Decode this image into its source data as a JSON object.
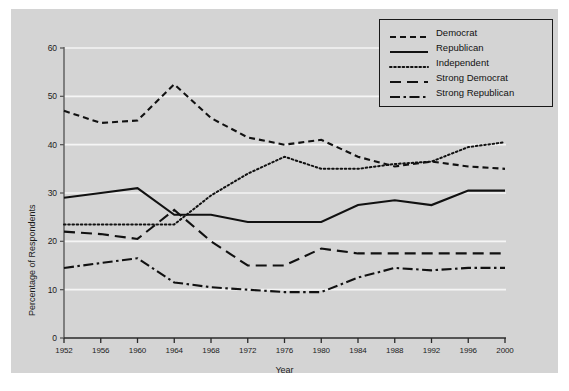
{
  "chart_data": {
    "type": "line",
    "title": "",
    "xlabel": "Year",
    "ylabel": "Percentage of Respondents",
    "grid": true,
    "legend_position": "top-right",
    "xlim": [
      1952,
      2000
    ],
    "ylim": [
      0,
      60
    ],
    "xticks": [
      "1952",
      "1956",
      "1960",
      "1964",
      "1968",
      "1972",
      "1976",
      "1980",
      "1984",
      "1988",
      "1992",
      "1996",
      "2000"
    ],
    "yticks": [
      "0",
      "10",
      "20",
      "30",
      "40",
      "50",
      "60"
    ],
    "x": [
      1952,
      1956,
      1960,
      1964,
      1968,
      1972,
      1976,
      1980,
      1984,
      1988,
      1992,
      1996,
      2000
    ],
    "series": [
      {
        "name": "Democrat",
        "style": "dashed",
        "color": "#111111",
        "values": [
          47.0,
          44.5,
          45.0,
          52.5,
          45.5,
          41.5,
          40.0,
          41.0,
          37.5,
          35.5,
          36.5,
          35.5,
          35.0
        ]
      },
      {
        "name": "Republican",
        "style": "solid",
        "color": "#111111",
        "values": [
          29.0,
          30.0,
          31.0,
          25.5,
          25.5,
          24.0,
          24.0,
          24.0,
          27.5,
          28.5,
          27.5,
          30.5,
          30.5
        ]
      },
      {
        "name": "Independent",
        "style": "dotted",
        "color": "#111111",
        "values": [
          23.5,
          23.5,
          23.5,
          23.5,
          29.5,
          34.0,
          37.5,
          35.0,
          35.0,
          36.0,
          36.5,
          39.5,
          40.5
        ]
      },
      {
        "name": "Strong Democrat",
        "style": "long-dash",
        "color": "#111111",
        "values": [
          22.0,
          21.5,
          20.5,
          26.5,
          20.0,
          15.0,
          15.0,
          18.5,
          17.5,
          17.5,
          17.5,
          17.5,
          17.5
        ]
      },
      {
        "name": "Strong Republican",
        "style": "dash-dot",
        "color": "#111111",
        "values": [
          14.5,
          15.5,
          16.5,
          11.5,
          10.5,
          10.0,
          9.5,
          9.5,
          12.5,
          14.5,
          14.0,
          14.5,
          14.5
        ]
      }
    ]
  },
  "legend": {
    "items": [
      {
        "label": "Democrat",
        "style": "dashed"
      },
      {
        "label": "Republican",
        "style": "solid"
      },
      {
        "label": "Independent",
        "style": "dotted"
      },
      {
        "label": "Strong Democrat",
        "style": "long-dash"
      },
      {
        "label": "Strong Republican",
        "style": "dash-dot"
      }
    ]
  },
  "colors": {
    "panel_background": "#d4d4d4",
    "gridline": "#f5f5f5",
    "axis": "#5a5a5a",
    "line": "#111111",
    "text": "#1c1c1c"
  }
}
